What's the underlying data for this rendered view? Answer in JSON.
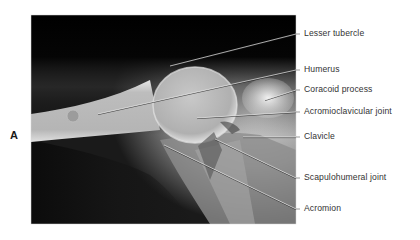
{
  "figure": {
    "panel_letter": "A",
    "image_alt": "Shoulder radiograph",
    "frame": {
      "x": 31,
      "y": 15,
      "width": 265,
      "height": 209
    },
    "labels": [
      {
        "text": "Lesser tubercle",
        "label_y": 34,
        "from": [
          170,
          66
        ],
        "to": [
          296,
          34
        ]
      },
      {
        "text": "Humerus",
        "label_y": 70,
        "from": [
          98,
          114
        ],
        "to": [
          296,
          70
        ]
      },
      {
        "text": "Coracoid process",
        "label_y": 90,
        "from": [
          265,
          100
        ],
        "to": [
          296,
          90
        ]
      },
      {
        "text": "Acromioclavicular joint",
        "label_y": 112,
        "from": [
          197,
          118
        ],
        "to": [
          296,
          112
        ]
      },
      {
        "text": "Clavicle",
        "label_y": 137,
        "from": [
          243,
          137
        ],
        "to": [
          296,
          137
        ]
      },
      {
        "text": "Scapulohumeral joint",
        "label_y": 178,
        "from": [
          215,
          139
        ],
        "to": [
          296,
          178
        ]
      },
      {
        "text": "Acromion",
        "label_y": 209,
        "from": [
          164,
          145
        ],
        "to": [
          296,
          209
        ]
      }
    ]
  }
}
